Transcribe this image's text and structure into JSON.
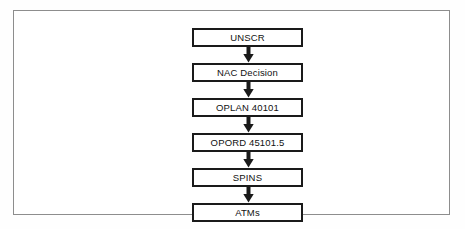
{
  "figure": {
    "kind": "flowchart",
    "orientation": "vertical-top-down",
    "background_color": "#ffffff",
    "frame_color": "#8d8d8d",
    "node_border_color": "#1a1a1a",
    "node_fill_color": "#ffffff",
    "text_color": "#111111",
    "arrow_color": "#1a1a1a"
  },
  "nodes": [
    {
      "id": "unscr",
      "label": "UNSCR"
    },
    {
      "id": "nac-decision",
      "label": "NAC Decision"
    },
    {
      "id": "oplan",
      "label": "OPLAN 40101"
    },
    {
      "id": "opord",
      "label": "OPORD 45101.5"
    },
    {
      "id": "spins",
      "label": "SPINS"
    },
    {
      "id": "atms",
      "label": "ATMs"
    }
  ],
  "arrows": [
    {
      "id": "arrow-unscr-to-nac",
      "from": "unscr",
      "to": "nac-decision",
      "direction": "down"
    },
    {
      "id": "arrow-nac-to-oplan",
      "from": "nac-decision",
      "to": "oplan",
      "direction": "down"
    },
    {
      "id": "arrow-oplan-to-opord",
      "from": "oplan",
      "to": "opord",
      "direction": "down"
    },
    {
      "id": "arrow-opord-to-spins",
      "from": "opord",
      "to": "spins",
      "direction": "down"
    },
    {
      "id": "arrow-spins-to-atms",
      "from": "spins",
      "to": "atms",
      "direction": "down"
    }
  ]
}
